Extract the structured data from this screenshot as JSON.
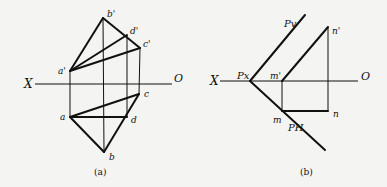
{
  "figure_a": {
    "caption": "(a)",
    "axis": {
      "left_label": "X",
      "right_label": "O"
    },
    "points": {
      "b_prime": {
        "label": "b'",
        "x": 103,
        "y": 18
      },
      "d_prime": {
        "label": "d'",
        "x": 127,
        "y": 35
      },
      "c_prime": {
        "label": "c'",
        "x": 140,
        "y": 48
      },
      "a_prime": {
        "label": "a'",
        "x": 70,
        "y": 71
      },
      "c": {
        "label": "c",
        "x": 139,
        "y": 94
      },
      "a": {
        "label": "a",
        "x": 70,
        "y": 117
      },
      "d": {
        "label": "d",
        "x": 127,
        "y": 117
      },
      "b": {
        "label": "b",
        "x": 104,
        "y": 152
      }
    }
  },
  "figure_b": {
    "caption": "(b)",
    "axis": {
      "left_label": "X",
      "right_label": "O"
    },
    "points": {
      "Px": {
        "label": "Px",
        "x": 250,
        "y": 81
      },
      "Pv": {
        "label": "Pv"
      },
      "PH": {
        "label": "PH"
      },
      "m_prime": {
        "label": "m'",
        "x": 282,
        "y": 81
      },
      "n_prime": {
        "label": "n'",
        "x": 328,
        "y": 27
      },
      "m": {
        "label": "m",
        "x": 282,
        "y": 111
      },
      "n": {
        "label": "n",
        "x": 328,
        "y": 111
      }
    }
  }
}
